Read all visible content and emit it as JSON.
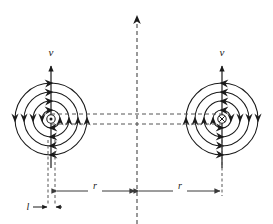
{
  "figure": {
    "background_color": "#ffffff",
    "stroke_color": "#1a1a1a",
    "dashed_color": "#555555",
    "width": 273,
    "height": 224
  },
  "labels": {
    "velocity_left": "v",
    "velocity_right": "v",
    "separation_left": "r",
    "separation_right": "r",
    "length_l": "l"
  },
  "conductors": [
    {
      "id": "left-conductor",
      "current_direction": "out-of-page",
      "symbol": "dot-in-circle",
      "center_x": 51,
      "center_y": 119,
      "field_sense": "counterclockwise",
      "field_radii": [
        9,
        18,
        27,
        36
      ],
      "velocity_label": "v",
      "velocity_direction": "up"
    },
    {
      "id": "right-conductor",
      "current_direction": "into-page",
      "symbol": "cross-in-circle",
      "center_x": 222,
      "center_y": 119,
      "field_sense": "clockwise",
      "field_radii": [
        9,
        18,
        27,
        36
      ],
      "velocity_label": "v",
      "velocity_direction": "up"
    }
  ],
  "axes": {
    "center_axis_x": 137,
    "center_axis_style": "dashed",
    "center_axis_arrow": "up"
  },
  "dimensions": [
    {
      "id": "dim-r-left",
      "label": "r",
      "from_x": 55,
      "to_x": 137,
      "y": 191
    },
    {
      "id": "dim-r-right",
      "label": "r",
      "from_x": 137,
      "to_x": 222,
      "y": 191
    },
    {
      "id": "dim-l",
      "label": "l",
      "from_x": 44,
      "to_x": 55,
      "y": 207
    }
  ],
  "horizontal_connectors": {
    "count": 2,
    "style": "dashed",
    "y_top": 114,
    "y_bottom": 124
  }
}
